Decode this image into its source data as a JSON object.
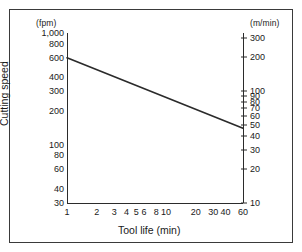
{
  "figure": {
    "left_unit_caption": "(fpm)",
    "right_unit_caption": "(m/min)",
    "ylabel": "Cutting speed",
    "xlabel": "Tool life (min)"
  },
  "chart_data": {
    "type": "line",
    "title": "",
    "xlabel": "Tool life (min)",
    "ylabel": "Cutting speed",
    "left_axis_unit": "(fpm)",
    "right_axis_unit": "(m/min)",
    "xscale": "log",
    "yscale": "log",
    "xlim": [
      1,
      60
    ],
    "ylim_left": [
      30,
      1000
    ],
    "ylim_right": [
      10,
      330
    ],
    "grid": false,
    "legend": null,
    "xticks": [
      {
        "value": 1,
        "label": "1"
      },
      {
        "value": 2,
        "label": "2"
      },
      {
        "value": 3,
        "label": "3"
      },
      {
        "value": 4,
        "label": "4"
      },
      {
        "value": 5,
        "label": "5"
      },
      {
        "value": 6,
        "label": "6"
      },
      {
        "value": 8,
        "label": "8"
      },
      {
        "value": 10,
        "label": "10"
      },
      {
        "value": 20,
        "label": "20"
      },
      {
        "value": 30,
        "label": "30"
      },
      {
        "value": 40,
        "label": "40"
      },
      {
        "value": 60,
        "label": "60"
      }
    ],
    "yticks_left": [
      {
        "value": 1000,
        "label": "1,000"
      },
      {
        "value": 800,
        "label": "800"
      },
      {
        "value": 600,
        "label": "600"
      },
      {
        "value": 400,
        "label": "400"
      },
      {
        "value": 300,
        "label": "300"
      },
      {
        "value": 200,
        "label": "200"
      },
      {
        "value": 100,
        "label": "100"
      },
      {
        "value": 80,
        "label": "80"
      },
      {
        "value": 60,
        "label": "60"
      },
      {
        "value": 40,
        "label": "40"
      },
      {
        "value": 30,
        "label": "30"
      }
    ],
    "yticks_right": [
      {
        "value": 300,
        "label": "300"
      },
      {
        "value": 200,
        "label": "200"
      },
      {
        "value": 100,
        "label": "100"
      },
      {
        "value": 90,
        "label": "90"
      },
      {
        "value": 80,
        "label": "80"
      },
      {
        "value": 70,
        "label": "70"
      },
      {
        "value": 60,
        "label": "60"
      },
      {
        "value": 50,
        "label": "50"
      },
      {
        "value": 40,
        "label": "40"
      },
      {
        "value": 30,
        "label": "30"
      },
      {
        "value": 20,
        "label": "20"
      },
      {
        "value": 10,
        "label": "10"
      }
    ],
    "series": [
      {
        "name": "Taylor tool-life curve",
        "color": "#2b2b2b",
        "x": [
          1,
          60
        ],
        "y": [
          600,
          140
        ]
      }
    ]
  }
}
